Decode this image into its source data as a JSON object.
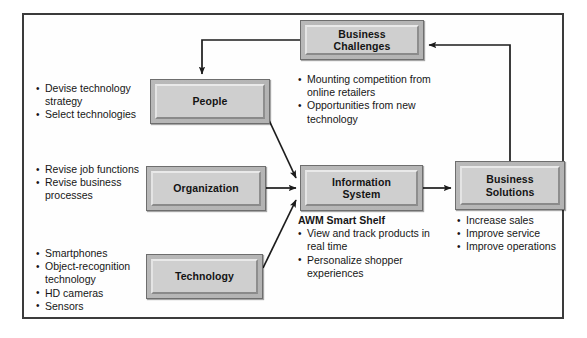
{
  "diagram": {
    "frame_border_color": "#3b3b3b",
    "box_fill_color": "#cfcfcf",
    "arrow_color": "#1c1c1c",
    "nodes": {
      "business_challenges": {
        "label": "Business\nChallenges"
      },
      "people": {
        "label": "People"
      },
      "organization": {
        "label": "Organization"
      },
      "technology": {
        "label": "Technology"
      },
      "information_system": {
        "label": "Information\nSystem"
      },
      "business_solutions": {
        "label": "Business\nSolutions"
      }
    },
    "text_blocks": {
      "people_bullets": {
        "items": [
          "Devise technology strategy",
          "Select technologies"
        ]
      },
      "organization_bullets": {
        "items": [
          "Revise job functions",
          "Revise business processes"
        ]
      },
      "technology_bullets": {
        "items": [
          "Smartphones",
          "Object-recognition technology",
          "HD cameras",
          "Sensors"
        ]
      },
      "business_challenges_bullets": {
        "items": [
          "Mounting competition from online retailers",
          "Opportunities from new technology"
        ]
      },
      "information_system_detail": {
        "heading": "AWM Smart Shelf",
        "items": [
          "View and track products in real time",
          "Personalize shopper experiences"
        ]
      },
      "business_solutions_bullets": {
        "items": [
          "Increase sales",
          "Improve service",
          "Improve operations"
        ]
      }
    },
    "connections": [
      {
        "name": "challenges-to-people",
        "from": "business_challenges",
        "to": "people"
      },
      {
        "name": "people-to-information-system",
        "from": "people",
        "to": "information_system"
      },
      {
        "name": "organization-to-information-system",
        "from": "organization",
        "to": "information_system"
      },
      {
        "name": "technology-to-information-system",
        "from": "technology",
        "to": "information_system"
      },
      {
        "name": "information-system-to-business-solutions",
        "from": "information_system",
        "to": "business_solutions"
      },
      {
        "name": "business-solutions-to-challenges",
        "from": "business_solutions",
        "to": "business_challenges"
      }
    ]
  }
}
